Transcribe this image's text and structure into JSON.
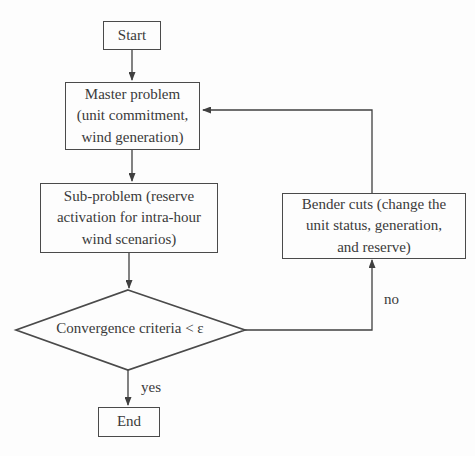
{
  "diagram": {
    "nodes": {
      "start": {
        "label": "Start",
        "shape": "rectangle"
      },
      "master": {
        "label": "Master problem\n(unit commitment,\nwind generation)",
        "shape": "rectangle"
      },
      "subproblem": {
        "label": "Sub-problem (reserve\nactivation for intra-hour\nwind scenarios)",
        "shape": "rectangle"
      },
      "bender": {
        "label": "Bender cuts (change the\nunit status, generation,\nand reserve)",
        "shape": "rectangle"
      },
      "decision": {
        "label": "Convergence criteria < ε",
        "shape": "diamond"
      },
      "end": {
        "label": "End",
        "shape": "rectangle"
      }
    },
    "edges": [
      {
        "from": "start",
        "to": "master",
        "label": ""
      },
      {
        "from": "master",
        "to": "subproblem",
        "label": ""
      },
      {
        "from": "subproblem",
        "to": "decision",
        "label": ""
      },
      {
        "from": "decision",
        "to": "end",
        "label": "yes"
      },
      {
        "from": "decision",
        "to": "bender",
        "label": "no"
      },
      {
        "from": "bender",
        "to": "master",
        "label": ""
      }
    ],
    "edge_labels": {
      "yes": "yes",
      "no": "no"
    },
    "colors": {
      "line": "#404040",
      "border": "#4a4a4a",
      "text": "#3a3a3a",
      "background": "#fdfdfd"
    }
  }
}
